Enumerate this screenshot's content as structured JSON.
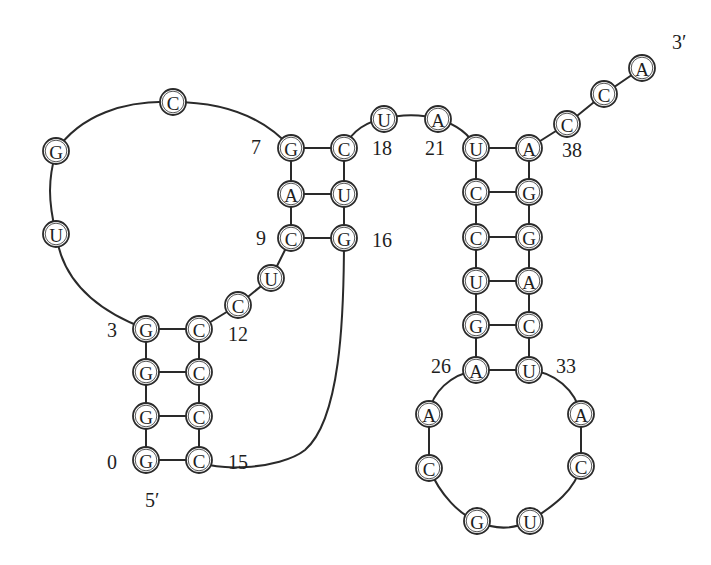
{
  "diagram": {
    "node_radius": 13,
    "colors": {
      "line": "#2a2a2a",
      "text": "#1e1e1e",
      "background": "#ffffff"
    },
    "end_labels": [
      {
        "id": "five-prime",
        "text": "5′",
        "x": 145,
        "y": 500
      },
      {
        "id": "three-prime",
        "text": "3′",
        "x": 672,
        "y": 42
      }
    ],
    "index_labels": [
      {
        "text": "0",
        "x": 107,
        "y": 462
      },
      {
        "text": "3",
        "x": 107,
        "y": 330
      },
      {
        "text": "7",
        "x": 251,
        "y": 147
      },
      {
        "text": "9",
        "x": 256,
        "y": 238
      },
      {
        "text": "12",
        "x": 228,
        "y": 334
      },
      {
        "text": "15",
        "x": 228,
        "y": 462
      },
      {
        "text": "16",
        "x": 372,
        "y": 240
      },
      {
        "text": "18",
        "x": 372,
        "y": 148
      },
      {
        "text": "21",
        "x": 425,
        "y": 148
      },
      {
        "text": "26",
        "x": 431,
        "y": 366
      },
      {
        "text": "33",
        "x": 556,
        "y": 366
      },
      {
        "text": "38",
        "x": 562,
        "y": 150
      }
    ],
    "nucleotides": [
      {
        "i": 0,
        "base": "G",
        "x": 146,
        "y": 460
      },
      {
        "i": 1,
        "base": "G",
        "x": 146,
        "y": 416
      },
      {
        "i": 2,
        "base": "G",
        "x": 146,
        "y": 372
      },
      {
        "i": 3,
        "base": "G",
        "x": 146,
        "y": 329
      },
      {
        "i": 4,
        "base": "U",
        "x": 56,
        "y": 234
      },
      {
        "i": 5,
        "base": "G",
        "x": 56,
        "y": 151
      },
      {
        "i": 6,
        "base": "C",
        "x": 173,
        "y": 102
      },
      {
        "i": 7,
        "base": "G",
        "x": 291,
        "y": 148
      },
      {
        "i": 8,
        "base": "A",
        "x": 291,
        "y": 194
      },
      {
        "i": 9,
        "base": "C",
        "x": 291,
        "y": 238
      },
      {
        "i": 10,
        "base": "U",
        "x": 271,
        "y": 278
      },
      {
        "i": 11,
        "base": "C",
        "x": 238,
        "y": 305
      },
      {
        "i": 12,
        "base": "C",
        "x": 199,
        "y": 329
      },
      {
        "i": 13,
        "base": "C",
        "x": 199,
        "y": 372
      },
      {
        "i": 14,
        "base": "C",
        "x": 199,
        "y": 416
      },
      {
        "i": 15,
        "base": "C",
        "x": 199,
        "y": 460
      },
      {
        "i": 16,
        "base": "G",
        "x": 344,
        "y": 238
      },
      {
        "i": 17,
        "base": "U",
        "x": 344,
        "y": 194
      },
      {
        "i": 18,
        "base": "C",
        "x": 344,
        "y": 148
      },
      {
        "i": 19,
        "base": "U",
        "x": 384,
        "y": 119
      },
      {
        "i": 20,
        "base": "A",
        "x": 438,
        "y": 119
      },
      {
        "i": 21,
        "base": "U",
        "x": 476,
        "y": 148
      },
      {
        "i": 22,
        "base": "C",
        "x": 476,
        "y": 192
      },
      {
        "i": 23,
        "base": "C",
        "x": 476,
        "y": 237
      },
      {
        "i": 24,
        "base": "U",
        "x": 476,
        "y": 281
      },
      {
        "i": 25,
        "base": "G",
        "x": 476,
        "y": 325
      },
      {
        "i": 26,
        "base": "A",
        "x": 476,
        "y": 370
      },
      {
        "i": 27,
        "base": "A",
        "x": 429,
        "y": 414
      },
      {
        "i": 28,
        "base": "C",
        "x": 429,
        "y": 468
      },
      {
        "i": 29,
        "base": "G",
        "x": 477,
        "y": 521
      },
      {
        "i": 30,
        "base": "U",
        "x": 530,
        "y": 521
      },
      {
        "i": 31,
        "base": "C",
        "x": 581,
        "y": 466
      },
      {
        "i": 32,
        "base": "A",
        "x": 581,
        "y": 414
      },
      {
        "i": 33,
        "base": "U",
        "x": 529,
        "y": 370
      },
      {
        "i": 34,
        "base": "C",
        "x": 529,
        "y": 325
      },
      {
        "i": 35,
        "base": "A",
        "x": 529,
        "y": 281
      },
      {
        "i": 36,
        "base": "G",
        "x": 529,
        "y": 237
      },
      {
        "i": 37,
        "base": "G",
        "x": 529,
        "y": 192
      },
      {
        "i": 38,
        "base": "A",
        "x": 529,
        "y": 148
      },
      {
        "i": 39,
        "base": "C",
        "x": 567,
        "y": 124
      },
      {
        "i": 40,
        "base": "C",
        "x": 604,
        "y": 94
      },
      {
        "i": 41,
        "base": "A",
        "x": 642,
        "y": 68
      }
    ],
    "base_pairs": [
      [
        0,
        15
      ],
      [
        1,
        14
      ],
      [
        2,
        13
      ],
      [
        3,
        12
      ],
      [
        7,
        18
      ],
      [
        8,
        17
      ],
      [
        9,
        16
      ],
      [
        21,
        38
      ],
      [
        22,
        37
      ],
      [
        23,
        36
      ],
      [
        24,
        35
      ],
      [
        25,
        34
      ],
      [
        26,
        33
      ]
    ],
    "backbone_paths": [
      {
        "from": 0,
        "to": 3,
        "d": "M146 460 L146 329"
      },
      {
        "from": 3,
        "to": 7,
        "d": "M146 329 C 95 310, 62 280, 56 234 C 48 200, 48 180, 56 151 C 80 115, 125 100, 173 102 C 220 102, 262 115, 291 148"
      },
      {
        "from": 7,
        "to": 9,
        "d": "M291 148 L291 238"
      },
      {
        "from": 9,
        "to": 12,
        "d": "M291 238 L271 278 L238 305 L199 329"
      },
      {
        "from": 12,
        "to": 15,
        "d": "M199 329 L199 460"
      },
      {
        "from": 15,
        "to": 16,
        "d": "M199 460 C 210 472, 280 470, 305 450 C 340 420, 344 320, 344 238"
      },
      {
        "from": 16,
        "to": 18,
        "d": "M344 238 L344 148"
      },
      {
        "from": 18,
        "to": 21,
        "d": "M344 148 C 352 130, 368 121, 384 119 C 400 114, 422 114, 438 119 C 458 125, 470 135, 476 148"
      },
      {
        "from": 21,
        "to": 26,
        "d": "M476 148 L476 370"
      },
      {
        "from": 26,
        "to": 33,
        "d": "M476 370 C 450 375, 432 392, 429 414 L429 468 C 440 495, 460 515, 477 521 C 495 530, 512 530, 530 521 C 555 505, 575 490, 581 466 L581 414 C 575 390, 555 372, 529 370"
      },
      {
        "from": 33,
        "to": 38,
        "d": "M529 370 L529 148"
      },
      {
        "from": 38,
        "to": 41,
        "d": "M529 148 L567 124 L604 94 L642 68"
      }
    ]
  }
}
